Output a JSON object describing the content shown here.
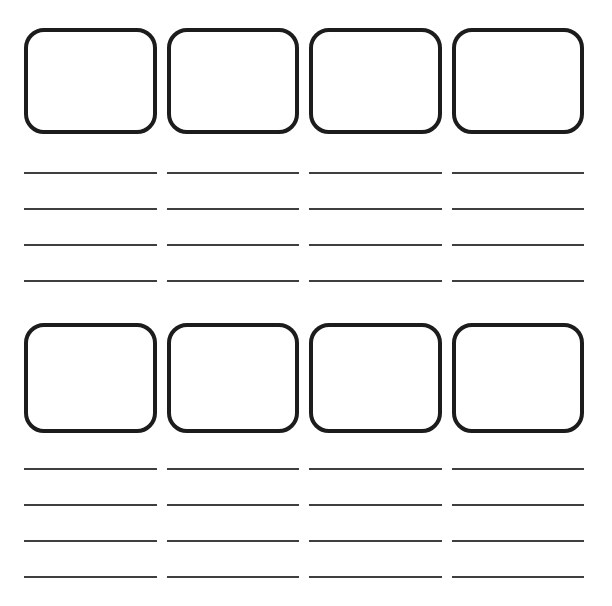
{
  "page": {
    "background_color": "#ffffff",
    "visible_text": ""
  },
  "style": {
    "frame_border_color": "#1c1c1c",
    "writing_line_color": "#3f3f3f"
  },
  "board": {
    "sections": [
      {
        "name": "top",
        "frame_count": 4,
        "lines_per_frame": 4
      },
      {
        "name": "bottom",
        "frame_count": 4,
        "lines_per_frame": 4
      }
    ]
  }
}
